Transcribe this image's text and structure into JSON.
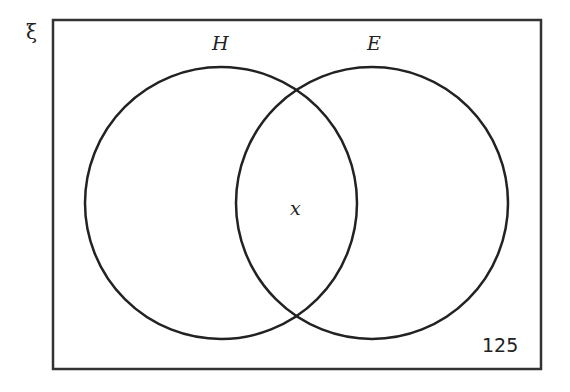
{
  "diagram": {
    "type": "venn",
    "universal_symbol": "ξ",
    "sets": [
      {
        "name": "H",
        "label": "H"
      },
      {
        "name": "E",
        "label": "E"
      }
    ],
    "regions": {
      "intersection": "x",
      "outside": "125"
    },
    "colors": {
      "stroke": "#222222",
      "background": "#ffffff"
    }
  }
}
